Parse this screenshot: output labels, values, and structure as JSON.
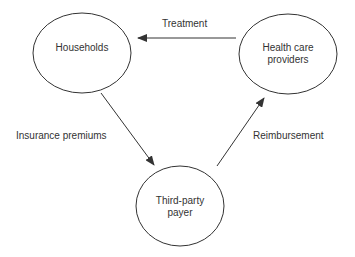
{
  "nodes": {
    "households": {
      "label": "Households"
    },
    "providers": {
      "line1": "Health care",
      "line2": "providers"
    },
    "payer": {
      "line1": "Third-party",
      "line2": "payer"
    }
  },
  "edges": {
    "treatment": {
      "label": "Treatment",
      "from": "Health care providers",
      "to": "Households"
    },
    "premiums": {
      "label": "Insurance premiums",
      "from": "Households",
      "to": "Third-party payer"
    },
    "reimbursement": {
      "label": "Reimbursement",
      "from": "Third-party payer",
      "to": "Health care providers"
    }
  },
  "colors": {
    "stroke": "#333333",
    "text": "#333333",
    "background": "#ffffff"
  }
}
